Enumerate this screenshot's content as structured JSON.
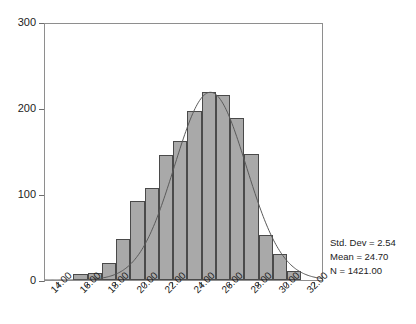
{
  "chart_data": {
    "type": "bar",
    "title": "",
    "subtitle": "",
    "xlabel": "",
    "ylabel": "",
    "xlim": [
      13.0,
      32.6
    ],
    "ylim": [
      0,
      300
    ],
    "grid": false,
    "legend_position": "none",
    "bin_width": 1.0,
    "categories": [
      "15.5",
      "16.5",
      "17.5",
      "18.5",
      "19.5",
      "20.5",
      "21.5",
      "22.5",
      "23.5",
      "24.5",
      "25.5",
      "26.5",
      "27.5",
      "28.5",
      "29.5",
      "30.5"
    ],
    "bin_centers": [
      15.5,
      16.5,
      17.5,
      18.5,
      19.5,
      20.5,
      21.5,
      22.5,
      23.5,
      24.5,
      25.5,
      26.5,
      27.5,
      28.5,
      29.5,
      30.5
    ],
    "values": [
      7,
      8,
      20,
      48,
      92,
      107,
      145,
      162,
      196,
      219,
      215,
      188,
      147,
      52,
      30,
      10
    ],
    "x_tick_labels": [
      "14.00",
      "16.00",
      "18.00",
      "20.00",
      "22.00",
      "24.00",
      "26.00",
      "28.00",
      "30.00",
      "32.00"
    ],
    "x_tick_values": [
      14,
      16,
      18,
      20,
      22,
      24,
      26,
      28,
      30,
      32
    ],
    "y_tick_labels": [
      "0",
      "100",
      "200",
      "300"
    ],
    "y_tick_values": [
      0,
      100,
      200,
      300
    ],
    "overlay": {
      "type": "normal-curve",
      "mean": 24.7,
      "std_dev": 2.54,
      "n": 1421,
      "peak_value": 220
    },
    "colors": {
      "bar_fill": "#a9a9a9",
      "bar_border": "#4a4a4a",
      "curve": "#5a5a5a",
      "axis": "#8e8e8e",
      "text": "#1c1c1c",
      "background": "#ffffff"
    }
  },
  "annotations": {
    "std_dev_label": "Std. Dev = 2.54",
    "mean_label": "Mean = 24.70",
    "n_label": "N = 1421.00"
  }
}
